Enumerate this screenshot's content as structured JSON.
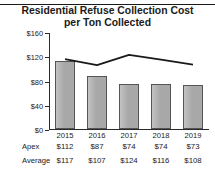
{
  "title": {
    "line1": "Residential Refuse Collection Cost",
    "line2": "per Ton Collected"
  },
  "chart_data": {
    "type": "bar",
    "title": "Residential Refuse Collection Cost per Ton Collected",
    "xlabel": "",
    "ylabel": "",
    "categories": [
      "2015",
      "2016",
      "2017",
      "2018",
      "2019"
    ],
    "ylim": [
      0,
      160
    ],
    "yticks": [
      0,
      40,
      80,
      120,
      160
    ],
    "ytick_labels": [
      "$0",
      "$40",
      "$80",
      "$120",
      "$160"
    ],
    "grid": false,
    "legend": "none",
    "series": [
      {
        "name": "Apex",
        "render": "bar",
        "color": "#a8a8a8",
        "values": [
          112,
          87,
          74,
          74,
          73
        ],
        "labels": [
          "$112",
          "$87",
          "$74",
          "$74",
          "$73"
        ]
      },
      {
        "name": "Average",
        "render": "line",
        "color": "#1a1a1a",
        "values": [
          117,
          107,
          124,
          116,
          108
        ],
        "labels": [
          "$117",
          "$107",
          "$124",
          "$116",
          "$108"
        ]
      }
    ]
  },
  "table": {
    "row_labels": [
      "Apex",
      "Average"
    ],
    "columns": [
      "2015",
      "2016",
      "2017",
      "2018",
      "2019"
    ],
    "rows": [
      [
        "$112",
        "$87",
        "$74",
        "$74",
        "$73"
      ],
      [
        "$117",
        "$107",
        "$124",
        "$116",
        "$108"
      ]
    ]
  },
  "colors": {
    "bar_fill": "#a8a8a8",
    "bar_stroke": "#555555",
    "line": "#1a1a1a",
    "axis": "#2a2a2a",
    "text": "#1a1a1a",
    "background": "#ffffff"
  }
}
